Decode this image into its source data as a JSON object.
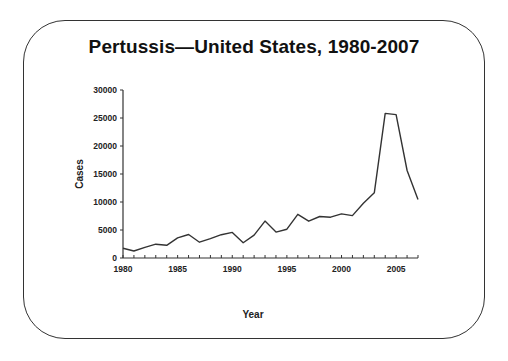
{
  "title": "Pertussis—United States, 1980-2007",
  "chart_data": {
    "type": "line",
    "title": "Pertussis—United States, 1980-2007",
    "xlabel": "Year",
    "ylabel": "Cases",
    "x": [
      1980,
      1981,
      1982,
      1983,
      1984,
      1985,
      1986,
      1987,
      1988,
      1989,
      1990,
      1991,
      1992,
      1993,
      1994,
      1995,
      1996,
      1997,
      1998,
      1999,
      2000,
      2001,
      2002,
      2003,
      2004,
      2005,
      2006,
      2007
    ],
    "series": [
      {
        "name": "Cases",
        "values": [
          1730,
          1248,
          1895,
          2463,
          2276,
          3589,
          4195,
          2823,
          3450,
          4157,
          4570,
          2719,
          4083,
          6586,
          4617,
          5137,
          7796,
          6564,
          7405,
          7288,
          7867,
          7580,
          9771,
          11647,
          25827,
          25616,
          15632,
          10454
        ]
      }
    ],
    "xlim": [
      1980,
      2007
    ],
    "ylim": [
      0,
      30000
    ],
    "x_tick_labels": [
      "1980",
      "1985",
      "1990",
      "1995",
      "2000",
      "2005"
    ],
    "y_tick_labels": [
      "0",
      "5000",
      "10000",
      "15000",
      "20000",
      "25000",
      "30000"
    ],
    "grid": false,
    "legend": false,
    "line_color": "#333333"
  }
}
